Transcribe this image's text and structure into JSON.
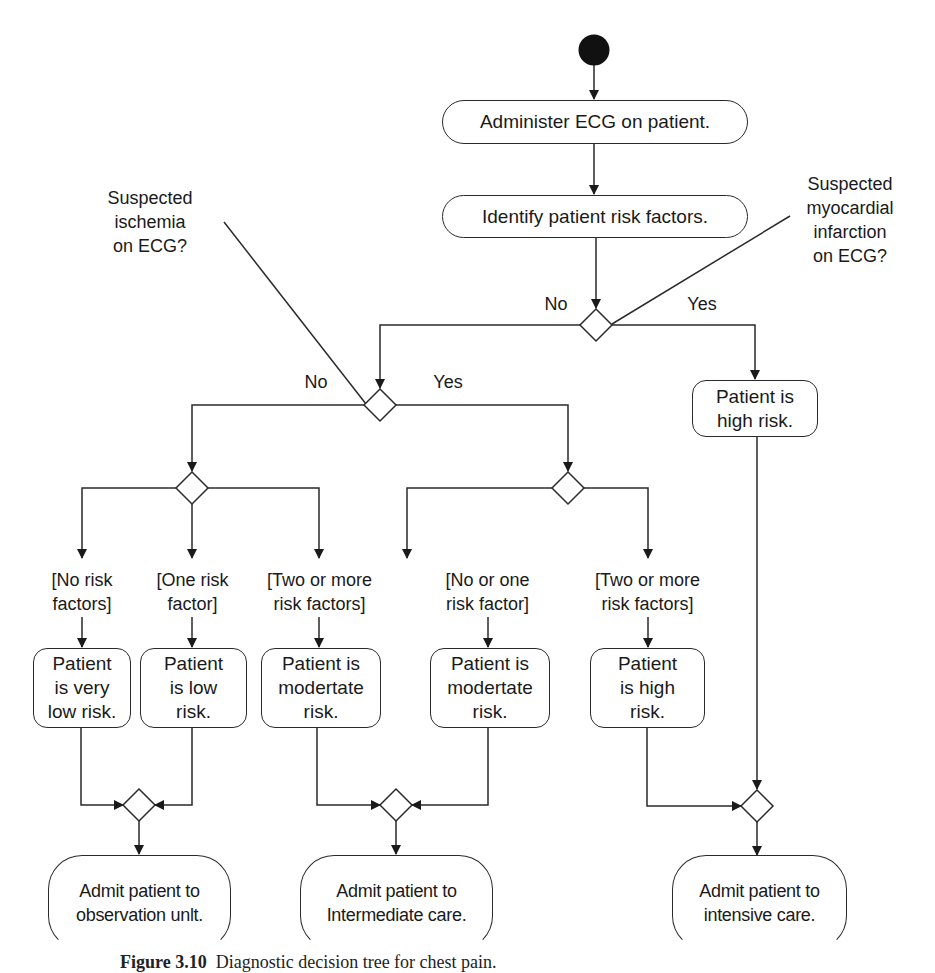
{
  "diagram": {
    "type": "UML activity diagram",
    "start": "initial-node",
    "actions": {
      "administer_ecg": "Administer ECG on patient.",
      "identify_risk": "Identify patient risk factors.",
      "high_risk_mi": "Patient is high risk.",
      "very_low_risk": "Patient is very low risk.",
      "low_risk": "Patient is low risk.",
      "moderate_risk_a": "Patient is modertate risk.",
      "moderate_risk_b": "Patient is modertate risk.",
      "high_risk_b": "Patient is high risk.",
      "admit_observation": "Admit patient to observation unlt.",
      "admit_intermediate": "Admit patient to Intermediate care.",
      "admit_intensive": "Admit patient to intensive care."
    },
    "decisions": {
      "mi": {
        "question": "Suspected myocardial infarction on ECG?",
        "no": "No",
        "yes": "Yes"
      },
      "ischemia": {
        "question": "Suspected ischemia on ECG?",
        "no": "No",
        "yes": "Yes"
      }
    },
    "guards": {
      "no_risk": "[No risk factors]",
      "one_risk": "[One risk factor]",
      "two_more_a": "[Two or more risk factors]",
      "no_or_one": "[No or one risk factor]",
      "two_more_b": "[Two or more risk factors]"
    },
    "display": {
      "administer_ecg": "Administer ECG on patient.",
      "identify_risk": "Identify patient risk factors.",
      "high_risk_mi": "Patient is\nhigh risk.",
      "very_low_risk": "Patient\nis very\nlow risk.",
      "low_risk": "Patient\nis low\nrisk.",
      "moderate_risk_a": "Patient is\nmodertate\nrisk.",
      "moderate_risk_b": "Patient is\nmodertate\nrisk.",
      "high_risk_b": "Patient\nis high\nrisk.",
      "admit_observation": "Admit patient to\nobservation unlt.",
      "admit_intermediate": "Admit patient to\nIntermediate care.",
      "admit_intensive": "Admit patient to\nintensive care.",
      "q_mi": "Suspected\nmyocardial\ninfarction\non ECG?",
      "q_ischemia": "Suspected\nischemia\non ECG?",
      "no": "No",
      "yes": "Yes",
      "g_no_risk": "[No risk\nfactors]",
      "g_one_risk": "[One risk\nfactor]",
      "g_two_more_a": "[Two or more\nrisk factors]",
      "g_no_or_one": "[No or one\nrisk factor]",
      "g_two_more_b": "[Two or more\nrisk factors]"
    },
    "caption": {
      "label": "Figure 3.10",
      "text": "Diagnostic decision tree for chest pain."
    },
    "colors": {
      "stroke": "#2a2a2a",
      "fill": "#ffffff",
      "start_node": "#111111"
    }
  }
}
